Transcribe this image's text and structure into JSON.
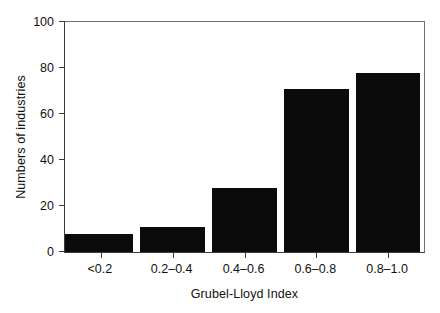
{
  "chart_data": {
    "type": "bar",
    "title": "",
    "xlabel": "Grubel-Lloyd Index",
    "ylabel": "Numbers of industries",
    "categories": [
      "<0.2",
      "0.2–0.4",
      "0.4–0.6",
      "0.6–0.8",
      "0.8–1.0"
    ],
    "values": [
      8,
      11,
      28,
      71,
      78
    ],
    "ylim": [
      0,
      100
    ],
    "yticks": [
      0,
      20,
      40,
      60,
      80,
      100
    ],
    "yticklabels": [
      "0",
      "20",
      "40",
      "60",
      "80",
      "100"
    ],
    "grid": false,
    "legend": null,
    "bar_color": "#0b0b0b",
    "axis_color": "#3a3a3a",
    "background_color": "#ffffff"
  }
}
